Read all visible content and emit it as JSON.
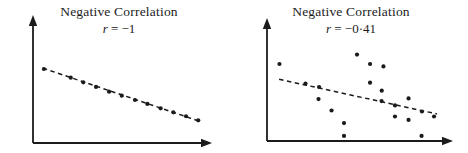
{
  "figure": {
    "background": "#ffffff",
    "ink_color": "#1b1b1b"
  },
  "chart_data": [
    {
      "type": "scatter",
      "title": "Negative Correlation",
      "subtitle_var": "r",
      "subtitle_value": "= −1",
      "correlation": -1,
      "xlabel": "",
      "ylabel": "",
      "tick_labels": "none",
      "gridlines": false,
      "legend": "none",
      "axis_arrows": true,
      "trend_line_style": "dashed",
      "axis_range_normalized": [
        0,
        100
      ],
      "points": [
        [
          6.1,
          57.8
        ],
        [
          21.1,
          51.0
        ],
        [
          28.1,
          47.4
        ],
        [
          35.2,
          43.8
        ],
        [
          42.5,
          40.1
        ],
        [
          49.6,
          37.0
        ],
        [
          57.0,
          33.6
        ],
        [
          63.9,
          30.5
        ],
        [
          71.3,
          27.1
        ],
        [
          78.4,
          24.0
        ],
        [
          85.5,
          20.9
        ],
        [
          92.3,
          17.7
        ]
      ],
      "trend": {
        "x1": 5.5,
        "y1": 58.5,
        "x2": 93.0,
        "y2": 17.0
      }
    },
    {
      "type": "scatter",
      "title": "Negative Correlation",
      "subtitle_var": "r",
      "subtitle_value": "= −0·41",
      "correlation": -0.41,
      "xlabel": "",
      "ylabel": "",
      "tick_labels": "none",
      "gridlines": false,
      "legend": "none",
      "axis_arrows": true,
      "trend_line_style": "dashed",
      "axis_range_normalized": [
        0,
        100
      ],
      "points": [
        [
          6.7,
          62.6
        ],
        [
          48.4,
          70.3
        ],
        [
          55.4,
          62.6
        ],
        [
          62.6,
          60.6
        ],
        [
          20.7,
          46.7
        ],
        [
          28.0,
          43.9
        ],
        [
          55.4,
          47.4
        ],
        [
          61.7,
          40.9
        ],
        [
          27.7,
          34.1
        ],
        [
          61.6,
          32.5
        ],
        [
          68.8,
          28.9
        ],
        [
          76.1,
          34.6
        ],
        [
          34.7,
          24.8
        ],
        [
          83.3,
          24.0
        ],
        [
          89.8,
          19.9
        ],
        [
          68.8,
          19.9
        ],
        [
          76.1,
          17.1
        ],
        [
          41.4,
          14.6
        ],
        [
          41.4,
          4.1
        ],
        [
          83.1,
          4.1
        ]
      ],
      "trend": {
        "x1": 6.5,
        "y1": 50.2,
        "x2": 91.4,
        "y2": 22.0
      }
    }
  ]
}
